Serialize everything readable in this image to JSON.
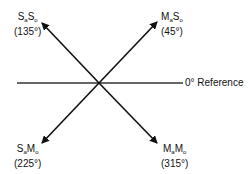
{
  "diagram": {
    "reference_label": "0° Reference",
    "quadrants": [
      {
        "id": "q45",
        "main1": "M",
        "sub1": "a",
        "main2": "S",
        "sub2": "o",
        "angle": "(45°)"
      },
      {
        "id": "q135",
        "main1": "S",
        "sub1": "a",
        "main2": "S",
        "sub2": "o",
        "angle": "(135°)"
      },
      {
        "id": "q225",
        "main1": "S",
        "sub1": "a",
        "main2": "M",
        "sub2": "o",
        "angle": "(225°)"
      },
      {
        "id": "q315",
        "main1": "M",
        "sub1": "a",
        "main2": "M",
        "sub2": "o",
        "angle": "(315°)"
      }
    ]
  }
}
